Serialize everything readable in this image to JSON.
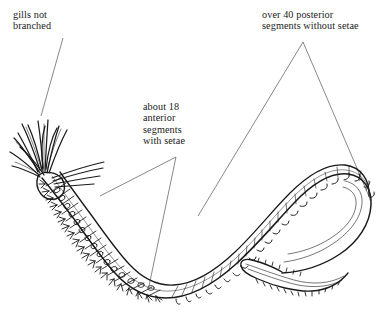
{
  "figure": {
    "background_color": "#ffffff",
    "ink_color": "#1a1a1a",
    "leader_line_color": "#555555",
    "width": 380,
    "height": 334
  },
  "annotations": [
    {
      "id": "gills",
      "name": "gills-not-branched-label",
      "lines": [
        "gills not",
        "branched"
      ],
      "text": "gills not branched",
      "leader": "single-diagonal-line",
      "points_to": "head gill filaments"
    },
    {
      "id": "anterior",
      "name": "anterior-segments-label",
      "lines": [
        "about 18",
        "anterior",
        "segments",
        "with setae"
      ],
      "text": "about 18 anterior segments with setae",
      "leader": "narrow-v-bracket",
      "points_to": "anterior body region bearing setae"
    },
    {
      "id": "posterior",
      "name": "posterior-segments-label",
      "lines": [
        "over 40 posterior",
        "segments without setae"
      ],
      "text": "over 40 posterior segments without setae",
      "leader": "wide-v-bracket",
      "points_to": "posterior body region lacking setae"
    }
  ],
  "anatomy": {
    "head": "anterior end at lower left with a tuft of unbranched, tapering gill filaments radiating up and to the left",
    "anterior_region": "about 18 segments bearing parapodial lobes and setae bundles along the outer margin",
    "posterior_region": "over 40 narrower segments marked only by small hook-like ticks, no setae",
    "tail": "posterior end curls into a hook and the tip tucks back to the left with a finely serrated margin"
  }
}
